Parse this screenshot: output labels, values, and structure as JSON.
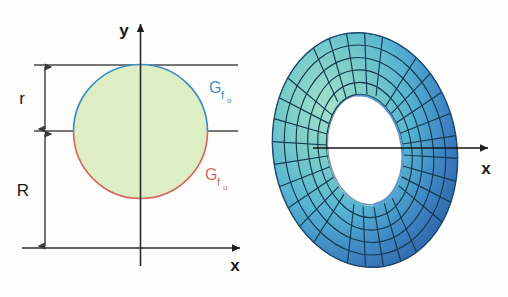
{
  "figure": {
    "background_color": "#fdfdfb"
  },
  "left_panel": {
    "name": "cross-section-diagram",
    "axes": {
      "y_axis_label": "y",
      "x_axis_label": "x",
      "axis_color": "#333333"
    },
    "dimensions": [
      {
        "id": "r",
        "label": "r",
        "description": "small radius, from mid line up to top line"
      },
      {
        "id": "R",
        "label": "R",
        "description": "large radius, from x-axis up to mid line"
      }
    ],
    "curves": [
      {
        "id": "upper",
        "label_main": "G",
        "label_sub": "f",
        "label_sub2": "o",
        "full_label": "G_f_o",
        "color": "#3d8fc4"
      },
      {
        "id": "lower",
        "label_main": "G",
        "label_sub": "f",
        "label_sub2": "u",
        "full_label": "G_f_u",
        "color": "#d6685f"
      }
    ],
    "circle": {
      "fill_color": "#ddeec4",
      "center_x": 140.5,
      "center_y": 131.5,
      "radius": 67
    },
    "guide_lines": {
      "top_line_y": 65,
      "mid_line_y": 131,
      "base_line_y": 248,
      "color": "#444444"
    }
  },
  "right_panel": {
    "name": "torus-3d",
    "axis_label": "x",
    "axis_color": "#111111",
    "surface_colors": {
      "highlight": "#8fd6c4",
      "mid": "#5ab8cf",
      "shade": "#3d7fc0",
      "dark": "#2f62a8",
      "mesh_line": "#153a4e"
    },
    "hole_color": "#ffffff"
  }
}
